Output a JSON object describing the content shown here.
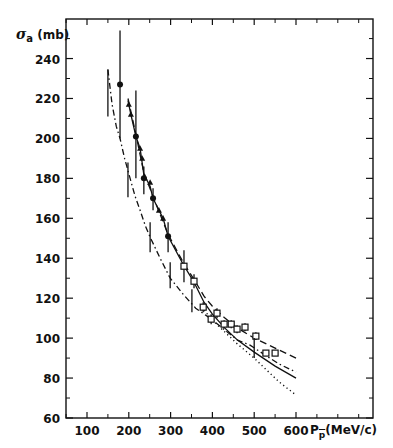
{
  "chart_data": {
    "type": "scatter",
    "title": "",
    "ylabel": "σa (mb)",
    "ylabel_symbol": "σ",
    "ylabel_sub": "a",
    "ylabel_unit": "(mb)",
    "xlabel": "Pp̄ (MeV/c)",
    "xlabel_symbol": "P",
    "xlabel_sub": "p",
    "xlabel_unit": "(MeV/c)",
    "xlim": [
      50,
      785
    ],
    "ylim": [
      60,
      260
    ],
    "grid": false,
    "x_ticks": [
      100,
      200,
      300,
      400,
      500,
      600
    ],
    "x_tick_labels": [
      "100",
      "200",
      "300",
      "400",
      "500",
      "600"
    ],
    "x_minor_ticks": [
      50,
      150,
      250,
      350,
      450,
      550,
      650,
      700,
      750
    ],
    "y_ticks": [
      60,
      80,
      100,
      120,
      140,
      160,
      180,
      200,
      220,
      240
    ],
    "y_tick_labels": [
      "60",
      "80",
      "100",
      "120",
      "140",
      "160",
      "180",
      "200",
      "220",
      "240"
    ],
    "y_minor_ticks": [
      70,
      90,
      110,
      130,
      150,
      170,
      190,
      210,
      230,
      250
    ],
    "series": [
      {
        "name": "filled circles",
        "marker": "circle-filled",
        "points": [
          {
            "x": 179,
            "y": 227,
            "ylo": 200,
            "yhi": 254
          },
          {
            "x": 217,
            "y": 201,
            "ylo": 180,
            "yhi": 224
          },
          {
            "x": 236,
            "y": 180,
            "ylo": 172,
            "yhi": 186
          },
          {
            "x": 258,
            "y": 170,
            "ylo": 164,
            "yhi": 175
          },
          {
            "x": 294,
            "y": 151,
            "ylo": 143,
            "yhi": 158
          }
        ]
      },
      {
        "name": "filled triangles",
        "marker": "triangle-filled",
        "points": [
          {
            "x": 200,
            "y": 217
          },
          {
            "x": 205,
            "y": 212
          },
          {
            "x": 227,
            "y": 195
          },
          {
            "x": 232,
            "y": 190
          },
          {
            "x": 251,
            "y": 178
          },
          {
            "x": 272,
            "y": 164
          },
          {
            "x": 282,
            "y": 160
          }
        ]
      },
      {
        "name": "open squares",
        "marker": "square-open",
        "points": [
          {
            "x": 332,
            "y": 136,
            "ylo": 128,
            "yhi": 144
          },
          {
            "x": 356,
            "y": 128.5,
            "ylo": 125,
            "yhi": 132
          },
          {
            "x": 378,
            "y": 115.5,
            "ylo": 113,
            "yhi": 118
          },
          {
            "x": 397,
            "y": 109.5,
            "ylo": 107,
            "yhi": 112
          },
          {
            "x": 411,
            "y": 112.5,
            "ylo": 110,
            "yhi": 115
          },
          {
            "x": 428,
            "y": 107,
            "ylo": 105,
            "yhi": 109
          },
          {
            "x": 445,
            "y": 107,
            "ylo": 105,
            "yhi": 109
          },
          {
            "x": 459,
            "y": 104.5,
            "ylo": 102.5,
            "yhi": 106.5
          },
          {
            "x": 478,
            "y": 105.5,
            "ylo": 103.5,
            "yhi": 107.5
          },
          {
            "x": 504,
            "y": 101,
            "ylo": 99,
            "yhi": 103
          },
          {
            "x": 528,
            "y": 92.5,
            "ylo": 91,
            "yhi": 94
          },
          {
            "x": 550,
            "y": 92.5,
            "ylo": 91,
            "yhi": 94
          }
        ]
      },
      {
        "name": "error bars (no marker)",
        "marker": "none",
        "points": [
          {
            "x": 150,
            "ylo": 211,
            "yhi": 234.5
          },
          {
            "x": 198,
            "ylo": 170.5,
            "yhi": 188
          },
          {
            "x": 251,
            "ylo": 143,
            "yhi": 158
          },
          {
            "x": 299,
            "ylo": 125,
            "yhi": 138
          },
          {
            "x": 351,
            "ylo": 113,
            "yhi": 124.5
          },
          {
            "x": 500,
            "ylo": 90,
            "yhi": 100
          }
        ]
      }
    ],
    "curves": [
      {
        "name": "solid",
        "style": "solid",
        "points": [
          [
            198,
            219
          ],
          [
            205,
            212
          ],
          [
            217,
            201
          ],
          [
            227,
            195
          ],
          [
            236,
            182
          ],
          [
            251,
            176
          ],
          [
            258,
            170
          ],
          [
            272,
            164
          ],
          [
            282,
            160
          ],
          [
            294,
            151
          ],
          [
            330,
            137
          ],
          [
            356,
            128
          ],
          [
            380,
            118
          ],
          [
            400,
            112
          ],
          [
            430,
            105
          ],
          [
            460,
            99
          ],
          [
            500,
            93
          ],
          [
            550,
            86
          ],
          [
            600,
            80
          ]
        ]
      },
      {
        "name": "dashed",
        "style": "dashed",
        "points": [
          [
            198,
            220
          ],
          [
            217,
            202
          ],
          [
            236,
            183
          ],
          [
            258,
            171
          ],
          [
            294,
            152
          ],
          [
            330,
            138
          ],
          [
            360,
            128
          ],
          [
            380,
            121
          ],
          [
            400,
            116
          ],
          [
            430,
            110
          ],
          [
            460,
            105
          ],
          [
            500,
            100
          ],
          [
            550,
            95
          ],
          [
            600,
            90
          ]
        ]
      },
      {
        "name": "dash-dot",
        "style": "dash-dot",
        "points": [
          [
            150,
            234.5
          ],
          [
            160,
            217
          ],
          [
            170,
            206
          ],
          [
            179,
            200
          ],
          [
            190,
            190
          ],
          [
            203,
            180
          ],
          [
            215,
            171
          ],
          [
            227,
            164
          ],
          [
            240,
            156
          ],
          [
            251,
            150.6
          ],
          [
            275,
            140
          ],
          [
            299,
            130
          ],
          [
            330,
            122
          ],
          [
            360,
            115
          ],
          [
            394,
            110
          ],
          [
            430,
            104
          ],
          [
            460,
            99
          ],
          [
            490,
            96.5
          ],
          [
            530,
            91
          ],
          [
            560,
            87
          ],
          [
            600,
            83
          ]
        ]
      },
      {
        "name": "dotted",
        "style": "dotted",
        "points": [
          [
            380,
            114
          ],
          [
            400,
            109
          ],
          [
            430,
            103
          ],
          [
            460,
            97
          ],
          [
            500,
            90
          ],
          [
            530,
            84
          ],
          [
            560,
            78
          ],
          [
            600,
            71.5
          ]
        ]
      }
    ]
  }
}
